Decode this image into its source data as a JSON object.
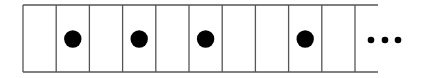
{
  "diagram": {
    "cells": [
      {
        "index": 0,
        "filled": false
      },
      {
        "index": 1,
        "filled": true
      },
      {
        "index": 2,
        "filled": false
      },
      {
        "index": 3,
        "filled": true
      },
      {
        "index": 4,
        "filled": false
      },
      {
        "index": 5,
        "filled": true
      },
      {
        "index": 6,
        "filled": false
      },
      {
        "index": 7,
        "filled": false
      },
      {
        "index": 8,
        "filled": true
      },
      {
        "index": 9,
        "filled": false
      }
    ],
    "continuation": "...",
    "colors": {
      "line": "#555555",
      "dot": "#000000",
      "background": "#ffffff"
    }
  }
}
